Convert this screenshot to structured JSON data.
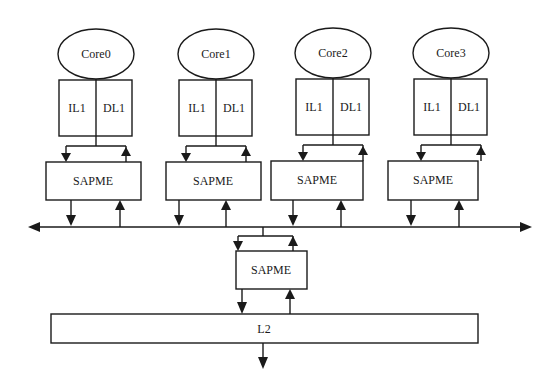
{
  "diagram": {
    "type": "multicore-memory-hierarchy",
    "colors": {
      "line": "#1a1a1a",
      "background": "#ffffff"
    },
    "cores": [
      {
        "label": "Core0",
        "il1": "IL1",
        "dl1": "DL1",
        "sapme": "SAPME"
      },
      {
        "label": "Core1",
        "il1": "IL1",
        "dl1": "DL1",
        "sapme": "SAPME"
      },
      {
        "label": "Core2",
        "il1": "IL1",
        "dl1": "DL1",
        "sapme": "SAPME"
      },
      {
        "label": "Core3",
        "il1": "IL1",
        "dl1": "DL1",
        "sapme": "SAPME"
      }
    ],
    "bus": {
      "label": "",
      "bidirectional": true
    },
    "shared_sapme": {
      "label": "SAPME"
    },
    "l2": {
      "label": "L2"
    }
  }
}
